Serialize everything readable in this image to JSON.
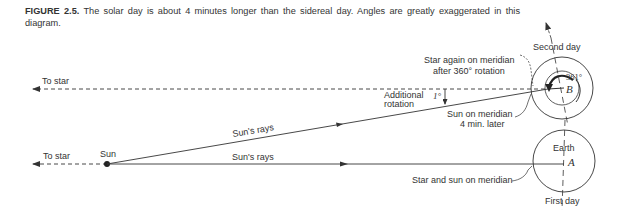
{
  "caption": {
    "label": "FIGURE 2.5.",
    "text": " The solar day is about 4 minutes longer than the sidereal day. Angles are greatly exaggerated in this diagram."
  },
  "labels": {
    "to_star_top": "To star",
    "to_star_bottom": "To star",
    "sun": "Sun",
    "suns_rays_upper": "Sun's rays",
    "suns_rays_lower": "Sun's rays",
    "additional_line1": "Additional",
    "additional_line2": "rotation",
    "one_degree": "1°",
    "star_again_line1": "Star again on meridian",
    "star_again_line2": "after 360° rotation",
    "sun_meridian_line1": "Sun on meridian",
    "sun_meridian_line2": "4 min. later",
    "star_and_sun": "Star and sun on meridian",
    "second_day": "Second day",
    "first_day": "First day",
    "earth": "Earth",
    "angle_361": "361°",
    "point_a": "A",
    "point_b": "B"
  },
  "colors": {
    "line": "#333333",
    "background": "#ffffff"
  }
}
